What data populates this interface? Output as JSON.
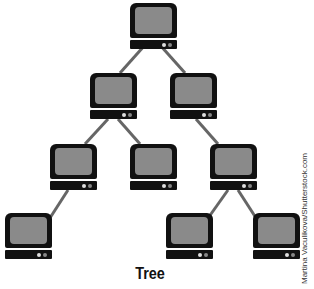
{
  "diagram": {
    "title": "Tree",
    "credit": "Martina Vaculikova/Shutterstock.com",
    "node_icon": "computer-monitor-icon",
    "colors": {
      "frame": "#111111",
      "screen": "#8a8a8a",
      "edge": "#666666"
    },
    "nodes": [
      {
        "id": "n1",
        "level": 1,
        "x": 130,
        "y": 3
      },
      {
        "id": "n2",
        "level": 2,
        "x": 90,
        "y": 73
      },
      {
        "id": "n3",
        "level": 2,
        "x": 170,
        "y": 73
      },
      {
        "id": "n4",
        "level": 3,
        "x": 50,
        "y": 144
      },
      {
        "id": "n5",
        "level": 3,
        "x": 130,
        "y": 144
      },
      {
        "id": "n6",
        "level": 3,
        "x": 210,
        "y": 144
      },
      {
        "id": "n7",
        "level": 4,
        "x": 5,
        "y": 213
      },
      {
        "id": "n8",
        "level": 4,
        "x": 166,
        "y": 213
      },
      {
        "id": "n9",
        "level": 4,
        "x": 253,
        "y": 213
      }
    ],
    "edges": [
      [
        "n1",
        "n2"
      ],
      [
        "n1",
        "n3"
      ],
      [
        "n2",
        "n4"
      ],
      [
        "n2",
        "n5"
      ],
      [
        "n3",
        "n6"
      ],
      [
        "n4",
        "n7"
      ],
      [
        "n6",
        "n8"
      ],
      [
        "n6",
        "n9"
      ]
    ]
  }
}
